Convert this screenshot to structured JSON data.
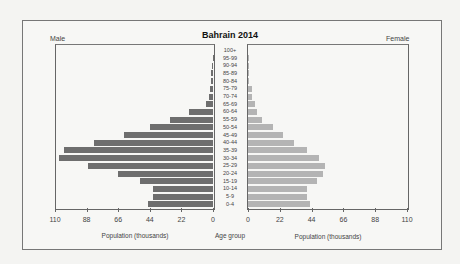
{
  "chart_data": {
    "type": "bar",
    "title": "Bahrain 2014",
    "orientation": "horizontal-population-pyramid",
    "categories": [
      "0-4",
      "5-9",
      "10-14",
      "15-19",
      "20-24",
      "25-29",
      "30-34",
      "35-39",
      "40-44",
      "45-49",
      "50-54",
      "55-59",
      "60-64",
      "65-69",
      "70-74",
      "75-79",
      "80-84",
      "85-89",
      "90-94",
      "95-99",
      "100+"
    ],
    "series": [
      {
        "name": "Male",
        "color": "#6e6e6e",
        "values": [
          45,
          42,
          42,
          51,
          66,
          87,
          107,
          104,
          83,
          62,
          44,
          30,
          17,
          5,
          3,
          2,
          1.5,
          1.5,
          0.5,
          0.2,
          0
        ]
      },
      {
        "name": "Female",
        "color": "#b4b4b4",
        "values": [
          43,
          41,
          41,
          48,
          52,
          53,
          49,
          41,
          32,
          24,
          17,
          10,
          6,
          5,
          3,
          3,
          1,
          1,
          0.5,
          0.2,
          0
        ]
      }
    ],
    "xlabel_left": "Population (thousands)",
    "xlabel_right": "Population (thousands)",
    "center_label": "Age group",
    "xticks": [
      0,
      22,
      44,
      66,
      88,
      110
    ],
    "xlim": [
      0,
      110
    ],
    "legend": {
      "left": "Male",
      "right": "Female"
    },
    "grid": false
  },
  "labels": {
    "title": "Bahrain 2014",
    "male": "Male",
    "female": "Female",
    "xlabel_left": "Population (thousands)",
    "xlabel_right": "Population (thousands)",
    "center": "Age group",
    "ticks": [
      "0",
      "22",
      "44",
      "66",
      "88",
      "110"
    ]
  }
}
